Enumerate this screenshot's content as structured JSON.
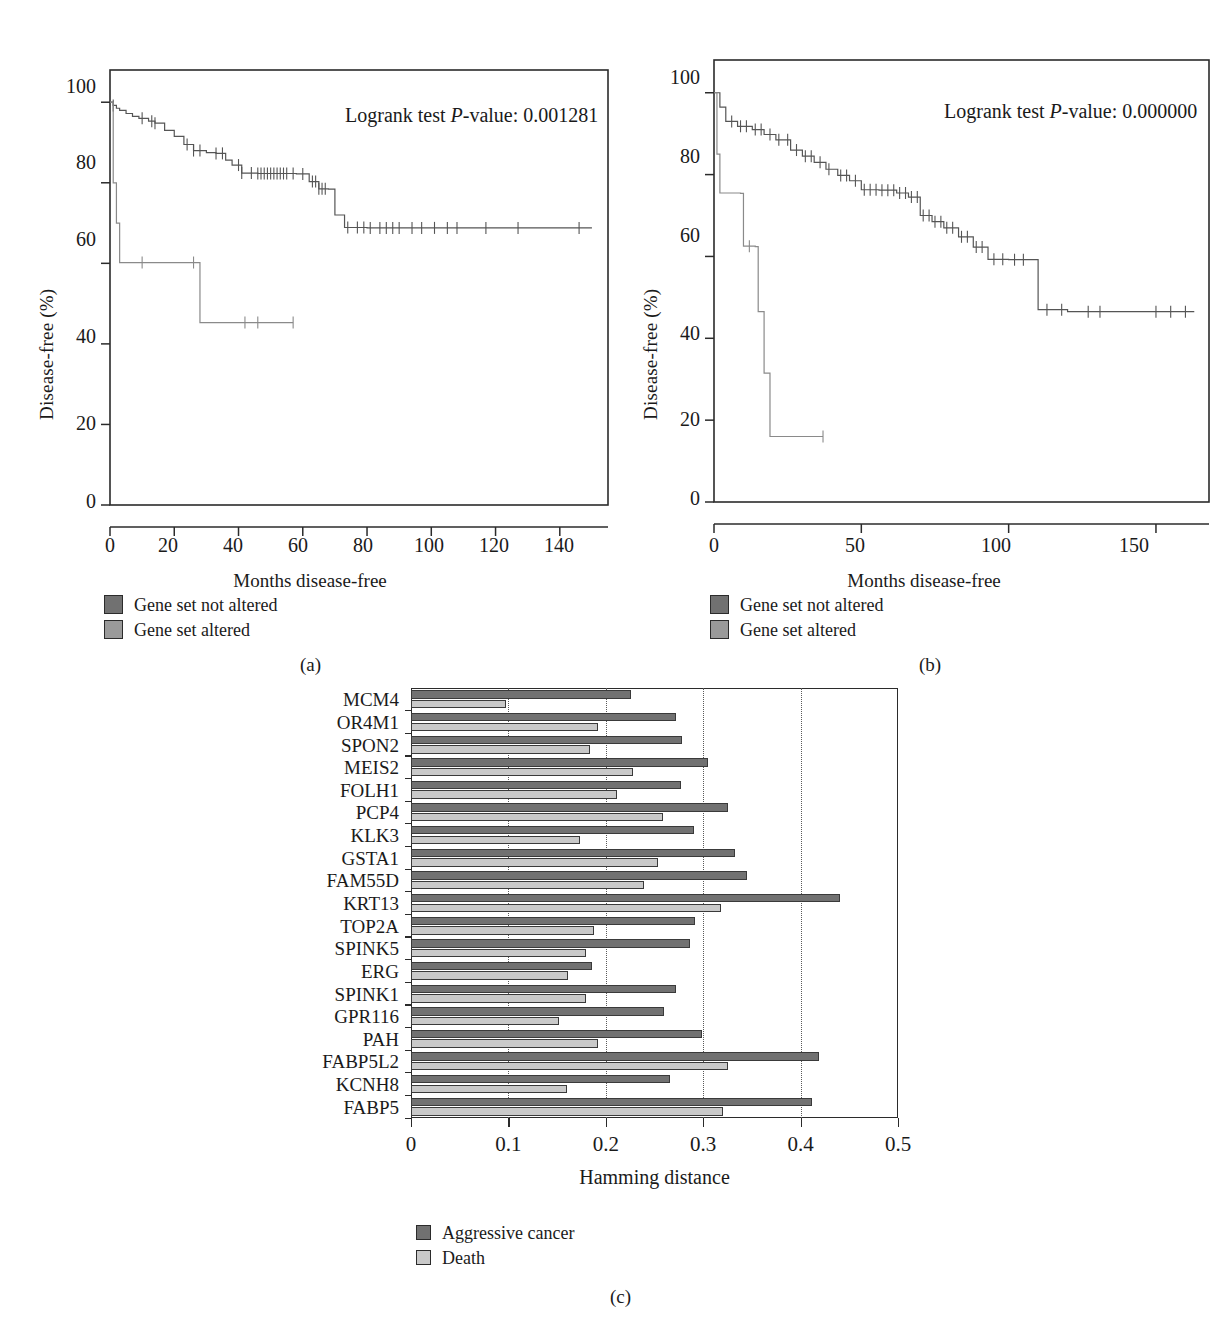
{
  "figure": {
    "panel_a_label": "(a)",
    "panel_b_label": "(b)",
    "panel_c_label": "(c)"
  },
  "km_a": {
    "annotation": "Logrank test P-value: 0.001281",
    "annotation_prefix": "Logrank test ",
    "annotation_italic": "P",
    "annotation_suffix": "-value: 0.001281",
    "ylabel": "Disease-free (%)",
    "xlabel": "Months disease-free",
    "yticks": [
      "100",
      "80",
      "60",
      "40",
      "20",
      "0"
    ],
    "xticks": [
      "0",
      "20",
      "40",
      "60",
      "80",
      "100",
      "120",
      "140"
    ],
    "legend": [
      {
        "label": "Gene set not altered",
        "color": "#717171"
      },
      {
        "label": "Gene set altered",
        "color": "#9a9a9a"
      }
    ]
  },
  "km_b": {
    "annotation_prefix": "Logrank test ",
    "annotation_italic": "P",
    "annotation_suffix": "-value: 0.000000",
    "ylabel": "Disease-free (%)",
    "xlabel": "Months disease-free",
    "yticks": [
      "100",
      "80",
      "60",
      "40",
      "20",
      "0"
    ],
    "xticks": [
      "0",
      "50",
      "100",
      "150"
    ],
    "legend": [
      {
        "label": "Gene set not altered",
        "color": "#717171"
      },
      {
        "label": "Gene set altered",
        "color": "#9a9a9a"
      }
    ]
  },
  "chart_data": [
    {
      "type": "line",
      "id": "kaplan-meier-a",
      "title": "",
      "xlabel": "Months disease-free",
      "ylabel": "Disease-free (%)",
      "xlim": [
        0,
        155
      ],
      "ylim": [
        0,
        108
      ],
      "grid": false,
      "annotation": "Logrank test P-value: 0.001281",
      "legend_position": "below-left",
      "series": [
        {
          "name": "Gene set not altered",
          "color": "#717171",
          "points": [
            [
              0,
              100
            ],
            [
              1,
              99.2
            ],
            [
              2,
              98.5
            ],
            [
              3,
              98.0
            ],
            [
              5,
              97.2
            ],
            [
              7,
              96.5
            ],
            [
              9,
              96.0
            ],
            [
              12,
              95.3
            ],
            [
              14,
              94.8
            ],
            [
              17,
              93.0
            ],
            [
              20,
              91.5
            ],
            [
              23,
              89.5
            ],
            [
              26,
              88.0
            ],
            [
              30,
              87.5
            ],
            [
              33,
              87.3
            ],
            [
              36,
              85.6
            ],
            [
              38,
              84.4
            ],
            [
              41,
              82.4
            ],
            [
              46,
              82.3
            ],
            [
              52,
              82.3
            ],
            [
              58,
              82.2
            ],
            [
              62,
              80.3
            ],
            [
              65,
              78.5
            ],
            [
              68,
              78.4
            ],
            [
              70,
              72.0
            ],
            [
              73,
              68.9
            ],
            [
              80,
              68.8
            ],
            [
              95,
              68.8
            ],
            [
              110,
              68.8
            ],
            [
              125,
              68.8
            ],
            [
              150,
              68.8
            ]
          ],
          "censor_months": [
            1,
            10,
            13,
            14,
            24,
            26,
            28,
            33,
            35,
            40,
            41,
            44,
            46,
            47,
            48,
            49,
            50,
            51,
            52,
            53,
            54,
            55,
            57,
            60,
            63,
            64,
            65,
            66,
            67,
            74,
            77,
            79,
            81,
            84,
            86,
            88,
            90,
            94,
            97,
            101,
            105,
            108,
            117,
            127,
            146
          ]
        },
        {
          "name": "Gene set altered",
          "color": "#9a9a9a",
          "points": [
            [
              0,
              100
            ],
            [
              1,
              80
            ],
            [
              2,
              70
            ],
            [
              3,
              60.2
            ],
            [
              27,
              60.2
            ],
            [
              28,
              45.3
            ],
            [
              57,
              45.3
            ]
          ],
          "censor_months": [
            10,
            26,
            42,
            46,
            57
          ]
        }
      ]
    },
    {
      "type": "line",
      "id": "kaplan-meier-b",
      "title": "",
      "xlabel": "Months disease-free",
      "ylabel": "Disease-free (%)",
      "xlim": [
        0,
        168
      ],
      "ylim": [
        0,
        108
      ],
      "grid": false,
      "annotation": "Logrank test P-value: 0.000000",
      "legend_position": "below-left",
      "series": [
        {
          "name": "Gene set not altered",
          "color": "#717171",
          "points": [
            [
              0,
              100
            ],
            [
              2,
              96.5
            ],
            [
              4,
              93.0
            ],
            [
              8,
              91.8
            ],
            [
              13,
              91.0
            ],
            [
              17,
              89.8
            ],
            [
              21,
              88.5
            ],
            [
              26,
              86.0
            ],
            [
              30,
              84.5
            ],
            [
              34,
              83.0
            ],
            [
              38,
              81.3
            ],
            [
              42,
              79.8
            ],
            [
              46,
              78.5
            ],
            [
              50,
              76.3
            ],
            [
              56,
              76.2
            ],
            [
              62,
              75.5
            ],
            [
              66,
              74.5
            ],
            [
              70,
              70.0
            ],
            [
              74,
              68.5
            ],
            [
              78,
              67.0
            ],
            [
              83,
              64.8
            ],
            [
              88,
              62.3
            ],
            [
              93,
              59.3
            ],
            [
              100,
              59.2
            ],
            [
              108,
              59.2
            ],
            [
              110,
              47.0
            ],
            [
              120,
              46.5
            ],
            [
              140,
              46.5
            ],
            [
              163,
              46.5
            ]
          ],
          "censor_months": [
            6,
            9,
            11,
            14,
            16,
            19,
            22,
            25,
            28,
            31,
            33,
            36,
            39,
            43,
            45,
            48,
            51,
            53,
            55,
            57,
            59,
            61,
            63,
            65,
            67,
            69,
            71,
            73,
            75,
            77,
            79,
            81,
            84,
            86,
            89,
            91,
            95,
            98,
            102,
            105,
            113,
            118,
            127,
            131,
            150,
            155,
            160
          ]
        },
        {
          "name": "Gene set altered",
          "color": "#9a9a9a",
          "points": [
            [
              0,
              100
            ],
            [
              1,
              85
            ],
            [
              2,
              75.5
            ],
            [
              9,
              75.4
            ],
            [
              10,
              62.5
            ],
            [
              14,
              62.4
            ],
            [
              15,
              46.5
            ],
            [
              17,
              31.5
            ],
            [
              19,
              16.0
            ],
            [
              37,
              16.0
            ]
          ],
          "censor_months": [
            12,
            37
          ]
        }
      ]
    },
    {
      "type": "bar",
      "id": "hamming-distance",
      "orientation": "horizontal",
      "title": "",
      "xlabel": "Hamming distance",
      "ylabel": "",
      "xlim": [
        0,
        0.5
      ],
      "xticks": [
        0,
        0.1,
        0.2,
        0.3,
        0.4,
        0.5
      ],
      "xtick_labels": [
        "0",
        "0.1",
        "0.2",
        "0.3",
        "0.4",
        "0.5"
      ],
      "grid": true,
      "grid_axis": "x",
      "legend_position": "below",
      "categories": [
        "MCM4",
        "OR4M1",
        "SPON2",
        "MEIS2",
        "FOLH1",
        "PCP4",
        "KLK3",
        "GSTA1",
        "FAM55D",
        "KRT13",
        "TOP2A",
        "SPINK5",
        "ERG",
        "SPINK1",
        "GPR116",
        "PAH",
        "FABP5L2",
        "KCNH8",
        "FABP5"
      ],
      "series": [
        {
          "name": "Aggressive cancer",
          "color": "#717171",
          "values": [
            0.226,
            0.272,
            0.278,
            0.305,
            0.277,
            0.325,
            0.291,
            0.333,
            0.345,
            0.44,
            0.292,
            0.286,
            0.186,
            0.272,
            0.26,
            0.299,
            0.419,
            0.266,
            0.412
          ]
        },
        {
          "name": "Death",
          "color": "#c9c9c9",
          "values": [
            0.098,
            0.192,
            0.184,
            0.228,
            0.212,
            0.259,
            0.173,
            0.254,
            0.239,
            0.318,
            0.188,
            0.18,
            0.161,
            0.18,
            0.152,
            0.192,
            0.325,
            0.16,
            0.32
          ]
        }
      ]
    }
  ]
}
